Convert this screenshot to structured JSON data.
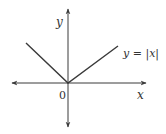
{
  "diagram": {
    "axes": {
      "x_label": "x",
      "y_label": "y",
      "origin_label": "0"
    },
    "curve": {
      "label": "y = |x|",
      "function": "abs(x)"
    },
    "colors": {
      "axis": "#3a3a3a",
      "curve": "#3a3a3a",
      "text": "#333333"
    }
  }
}
